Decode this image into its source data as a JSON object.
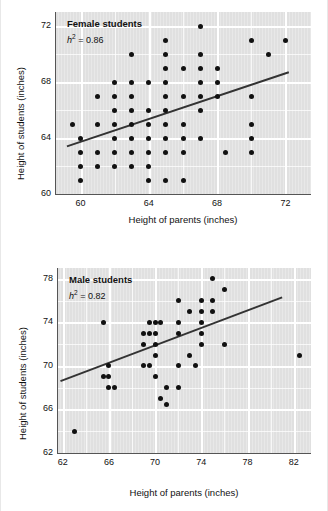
{
  "page": {
    "background_color": "#ffffff",
    "plot_background_color": "#e0e0e0",
    "gridline_color": "#ffffff",
    "point_color": "#111111",
    "line_color": "#333333"
  },
  "charts": [
    {
      "key": "female",
      "title": "Female students",
      "annotation_symbol": "h",
      "annotation_exponent": "2",
      "annotation_value": " = 0.86",
      "annotation_text": "h² = 0.86",
      "xlabel": "Height of parents (inches)",
      "ylabel": "Height of students (inches)",
      "xticks": [
        "60",
        "64",
        "68",
        "72"
      ],
      "yticks": [
        "72",
        "68",
        "64",
        "60"
      ]
    },
    {
      "key": "male",
      "title": "Male students",
      "annotation_symbol": "h",
      "annotation_exponent": "2",
      "annotation_value": " = 0.82",
      "annotation_text": "h² = 0.82",
      "xlabel": "Height of parents (inches)",
      "ylabel": "Height of students (inches)",
      "xticks": [
        "62",
        "66",
        "70",
        "74",
        "78",
        "82"
      ],
      "yticks": [
        "78",
        "74",
        "70",
        "66",
        "62"
      ]
    }
  ],
  "chart_data": [
    {
      "type": "scatter",
      "title": "Female students",
      "annotation": "h² = 0.86",
      "xlabel": "Height of parents (inches)",
      "ylabel": "Height of students (inches)",
      "xlim": [
        58.5,
        73.5
      ],
      "ylim": [
        60,
        73
      ],
      "xticks": [
        60,
        64,
        68,
        72
      ],
      "yticks": [
        60,
        64,
        68,
        72
      ],
      "grid": true,
      "legend": "none",
      "points": [
        [
          59.5,
          65.0
        ],
        [
          60.0,
          64.0
        ],
        [
          60.0,
          63.0
        ],
        [
          60.0,
          62.0
        ],
        [
          60.0,
          61.0
        ],
        [
          61.0,
          67.0
        ],
        [
          61.0,
          65.0
        ],
        [
          61.0,
          63.0
        ],
        [
          61.0,
          62.0
        ],
        [
          62.0,
          68.0
        ],
        [
          62.0,
          67.0
        ],
        [
          62.0,
          66.0
        ],
        [
          62.0,
          65.0
        ],
        [
          62.0,
          64.0
        ],
        [
          62.0,
          63.0
        ],
        [
          62.0,
          62.0
        ],
        [
          63.0,
          70.0
        ],
        [
          63.0,
          68.0
        ],
        [
          63.0,
          67.0
        ],
        [
          63.0,
          66.0
        ],
        [
          63.0,
          65.0
        ],
        [
          63.0,
          64.0
        ],
        [
          63.0,
          63.0
        ],
        [
          63.0,
          62.0
        ],
        [
          64.0,
          68.0
        ],
        [
          64.0,
          66.0
        ],
        [
          64.0,
          65.0
        ],
        [
          64.0,
          64.0
        ],
        [
          64.0,
          63.0
        ],
        [
          64.0,
          62.0
        ],
        [
          64.0,
          61.0
        ],
        [
          65.0,
          71.0
        ],
        [
          65.0,
          70.0
        ],
        [
          65.0,
          69.0
        ],
        [
          65.0,
          68.0
        ],
        [
          65.0,
          67.0
        ],
        [
          65.0,
          66.0
        ],
        [
          65.0,
          65.0
        ],
        [
          65.0,
          64.0
        ],
        [
          65.0,
          63.0
        ],
        [
          65.0,
          61.0
        ],
        [
          66.0,
          69.0
        ],
        [
          66.0,
          67.0
        ],
        [
          66.0,
          65.0
        ],
        [
          66.0,
          64.0
        ],
        [
          66.0,
          63.0
        ],
        [
          66.0,
          61.0
        ],
        [
          67.0,
          72.0
        ],
        [
          67.0,
          70.0
        ],
        [
          67.0,
          69.0
        ],
        [
          67.0,
          68.0
        ],
        [
          67.0,
          67.0
        ],
        [
          67.0,
          66.0
        ],
        [
          67.0,
          64.0
        ],
        [
          68.0,
          69.0
        ],
        [
          68.0,
          68.0
        ],
        [
          68.0,
          67.0
        ],
        [
          68.5,
          63.0
        ],
        [
          70.0,
          71.0
        ],
        [
          70.0,
          67.0
        ],
        [
          70.0,
          65.0
        ],
        [
          70.0,
          64.0
        ],
        [
          70.0,
          63.0
        ],
        [
          71.0,
          70.0
        ],
        [
          72.0,
          71.0
        ]
      ],
      "regression_line": {
        "x0": 59.2,
        "y0": 63.4,
        "x1": 72.2,
        "y1": 68.7
      }
    },
    {
      "type": "scatter",
      "title": "Male students",
      "annotation": "h² = 0.82",
      "xlabel": "Height of parents (inches)",
      "ylabel": "Height of students (inches)",
      "xlim": [
        61.5,
        83.5
      ],
      "ylim": [
        62,
        79
      ],
      "xticks": [
        62,
        66,
        70,
        74,
        78,
        82
      ],
      "yticks": [
        62,
        66,
        70,
        74,
        78
      ],
      "grid": true,
      "legend": "none",
      "points": [
        [
          63.0,
          64.0
        ],
        [
          65.5,
          74.0
        ],
        [
          65.5,
          69.0
        ],
        [
          66.0,
          70.0
        ],
        [
          66.0,
          69.0
        ],
        [
          66.0,
          68.0
        ],
        [
          66.5,
          68.0
        ],
        [
          69.0,
          73.0
        ],
        [
          69.0,
          72.0
        ],
        [
          69.0,
          70.0
        ],
        [
          69.5,
          74.0
        ],
        [
          69.5,
          73.0
        ],
        [
          69.5,
          70.0
        ],
        [
          70.0,
          74.0
        ],
        [
          70.0,
          73.0
        ],
        [
          70.0,
          72.0
        ],
        [
          70.0,
          71.0
        ],
        [
          70.0,
          69.0
        ],
        [
          70.5,
          74.0
        ],
        [
          70.5,
          67.0
        ],
        [
          71.0,
          68.0
        ],
        [
          71.0,
          66.5
        ],
        [
          72.0,
          76.0
        ],
        [
          72.0,
          74.0
        ],
        [
          72.0,
          73.0
        ],
        [
          72.0,
          70.0
        ],
        [
          72.0,
          68.0
        ],
        [
          73.0,
          75.0
        ],
        [
          73.0,
          71.0
        ],
        [
          73.5,
          70.0
        ],
        [
          74.0,
          76.0
        ],
        [
          74.0,
          75.0
        ],
        [
          74.0,
          74.0
        ],
        [
          74.0,
          73.0
        ],
        [
          74.0,
          72.0
        ],
        [
          75.0,
          78.0
        ],
        [
          75.0,
          76.0
        ],
        [
          75.0,
          75.0
        ],
        [
          76.0,
          77.0
        ],
        [
          76.0,
          72.0
        ],
        [
          82.5,
          71.0
        ]
      ],
      "regression_line": {
        "x0": 61.8,
        "y0": 68.6,
        "x1": 81.0,
        "y1": 76.3
      }
    }
  ]
}
